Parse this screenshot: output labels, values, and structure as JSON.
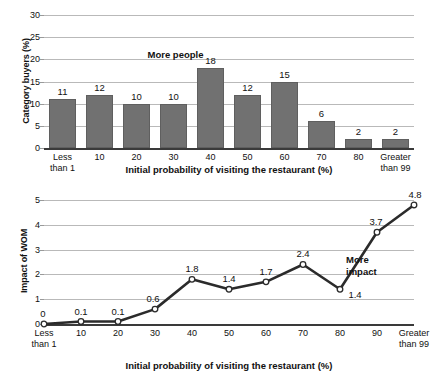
{
  "chart_data": [
    {
      "id": "top",
      "type": "bar",
      "title": "",
      "xlabel": "Initial probability of visiting the restaurant (%)",
      "ylabel": "Category buyers (%)",
      "categories": [
        "Less than 1",
        "10",
        "20",
        "30",
        "40",
        "50",
        "60",
        "70",
        "80",
        "Greater than 99"
      ],
      "category_lines": [
        [
          "Less",
          "than 1"
        ],
        [
          "10",
          ""
        ],
        [
          "20",
          ""
        ],
        [
          "30",
          ""
        ],
        [
          "40",
          ""
        ],
        [
          "50",
          ""
        ],
        [
          "60",
          ""
        ],
        [
          "70",
          ""
        ],
        [
          "80",
          ""
        ],
        [
          "Greater",
          "than 99"
        ]
      ],
      "values": [
        11,
        12,
        10,
        10,
        18,
        12,
        15,
        6,
        2,
        2
      ],
      "value_labels": [
        "11",
        "12",
        "10",
        "10",
        "18",
        "12",
        "15",
        "6",
        "2",
        "2"
      ],
      "ylim": [
        0,
        30
      ],
      "yticks": [
        0,
        5,
        10,
        15,
        20,
        25,
        30
      ],
      "ytick_labels": [
        "0",
        "5",
        "10",
        "15",
        "20",
        "25",
        "30"
      ],
      "grid": true,
      "legend": "none",
      "annotations": [
        {
          "text": "More people",
          "x_category": "30",
          "y_value": 21
        }
      ],
      "bar_color": "#717171"
    },
    {
      "id": "bottom",
      "type": "line",
      "title": "",
      "xlabel": "Initial probability of visiting the restaurant (%)",
      "ylabel": "Impact of WOM",
      "categories": [
        "Less than 1",
        "10",
        "20",
        "30",
        "40",
        "50",
        "60",
        "70",
        "80",
        "90",
        "Greater than 99"
      ],
      "category_lines": [
        [
          "Less",
          "than 1"
        ],
        [
          "10",
          ""
        ],
        [
          "20",
          ""
        ],
        [
          "30",
          ""
        ],
        [
          "40",
          ""
        ],
        [
          "50",
          ""
        ],
        [
          "60",
          ""
        ],
        [
          "70",
          ""
        ],
        [
          "80",
          ""
        ],
        [
          "90",
          ""
        ],
        [
          "Greater",
          "than 99"
        ]
      ],
      "values": [
        0,
        0.1,
        0.1,
        0.6,
        1.8,
        1.4,
        1.7,
        2.4,
        1.4,
        3.7,
        4.8
      ],
      "value_labels": [
        "0",
        "0.1",
        "0.1",
        "0.6",
        "1.8",
        "1.4",
        "1.7",
        "2.4",
        "1.4",
        "3.7",
        "4.8"
      ],
      "ylim": [
        0,
        5
      ],
      "yticks": [
        0,
        1,
        2,
        3,
        4,
        5
      ],
      "ytick_labels": [
        "0",
        "1",
        "2",
        "3",
        "4",
        "5"
      ],
      "grid": true,
      "legend": "none",
      "annotations": [
        {
          "text": "More",
          "x_category": "80",
          "y_value": 2.6
        },
        {
          "text": "impact",
          "x_category": "80",
          "y_value": 2.1
        }
      ],
      "line_color": "#2b2b2b",
      "marker_face_color": "#ffffff",
      "marker_edge_color": "#2b2b2b"
    }
  ],
  "top_chart": {
    "y_axis_title": "Category buyers (%)",
    "x_axis_title": "Initial probability of visiting the restaurant (%)",
    "annotation": "More people"
  },
  "bottom_chart": {
    "y_axis_title": "Impact of WOM",
    "x_axis_title": "Initial probability of visiting the restaurant (%)",
    "annotation_line1": "More",
    "annotation_line2": "impact"
  }
}
